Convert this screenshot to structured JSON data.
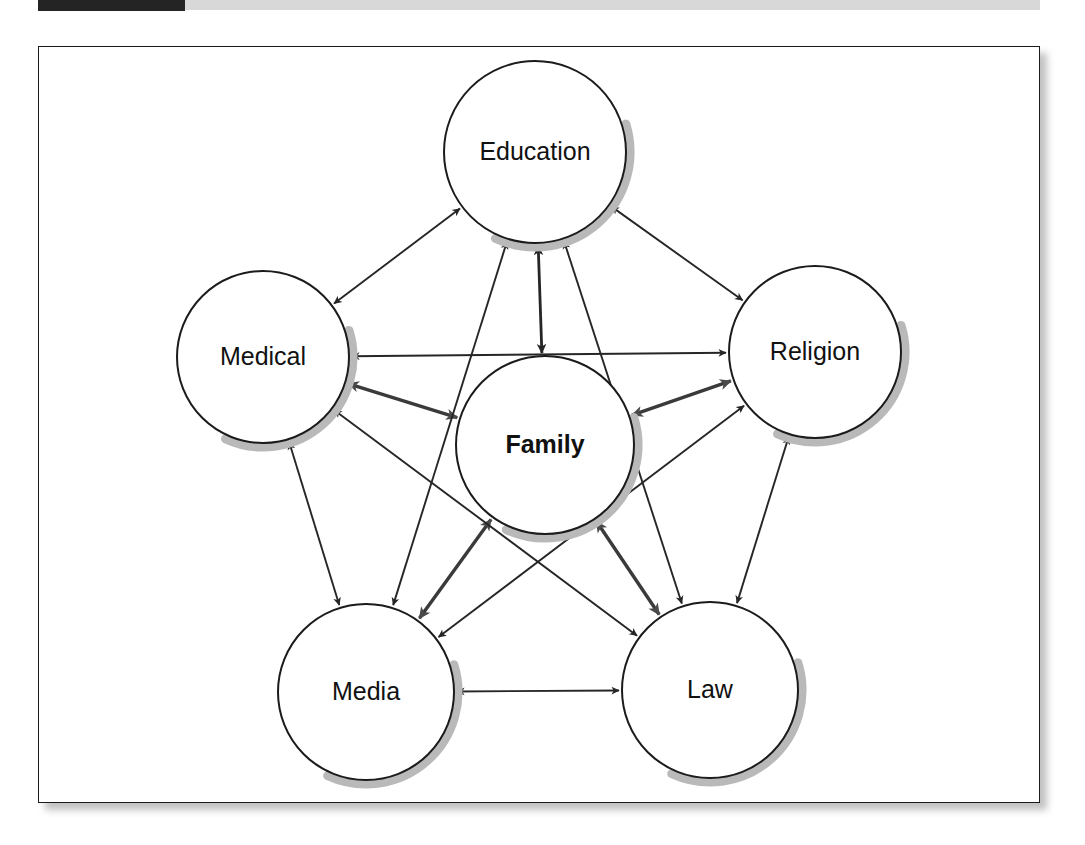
{
  "header": {
    "figure_tag": "",
    "band_color": "#d8d8d8",
    "tag_color": "#242424"
  },
  "figure": {
    "frame_color": "#1b1b1b",
    "background": "#ffffff",
    "shadow_color": "#b9b9b9"
  },
  "diagram": {
    "title": "",
    "type": "network",
    "node_fill": "#ffffff",
    "node_stroke": "#1b1b1b",
    "edge_color": "#262626",
    "emphasis_edge_color": "#3a3a3a",
    "nodes": [
      {
        "id": "education",
        "label": "Education",
        "cx": 535,
        "cy": 152,
        "r": 91,
        "bold": false
      },
      {
        "id": "medical",
        "label": "Medical",
        "cx": 263,
        "cy": 357,
        "r": 86,
        "bold": false
      },
      {
        "id": "religion",
        "label": "Religion",
        "cx": 815,
        "cy": 352,
        "r": 86,
        "bold": false
      },
      {
        "id": "family",
        "label": "Family",
        "cx": 545,
        "cy": 445,
        "r": 89,
        "bold": true
      },
      {
        "id": "media",
        "label": "Media",
        "cx": 366,
        "cy": 692,
        "r": 88,
        "bold": false
      },
      {
        "id": "law",
        "label": "Law",
        "cx": 710,
        "cy": 690,
        "r": 88,
        "bold": false
      }
    ],
    "edges": [
      {
        "from": "family",
        "to": "education",
        "weight": "medium",
        "bidirectional": true
      },
      {
        "from": "family",
        "to": "medical",
        "weight": "thick",
        "bidirectional": true
      },
      {
        "from": "family",
        "to": "religion",
        "weight": "thick",
        "bidirectional": true
      },
      {
        "from": "family",
        "to": "media",
        "weight": "thick",
        "bidirectional": true
      },
      {
        "from": "family",
        "to": "law",
        "weight": "thick",
        "bidirectional": true
      },
      {
        "from": "education",
        "to": "medical",
        "weight": "thin",
        "bidirectional": true
      },
      {
        "from": "education",
        "to": "religion",
        "weight": "thin",
        "bidirectional": true
      },
      {
        "from": "education",
        "to": "media",
        "weight": "thin",
        "bidirectional": true
      },
      {
        "from": "education",
        "to": "law",
        "weight": "thin",
        "bidirectional": true
      },
      {
        "from": "medical",
        "to": "religion",
        "weight": "thin",
        "bidirectional": true
      },
      {
        "from": "medical",
        "to": "media",
        "weight": "thin",
        "bidirectional": true
      },
      {
        "from": "medical",
        "to": "law",
        "weight": "thin",
        "bidirectional": true
      },
      {
        "from": "religion",
        "to": "media",
        "weight": "thin",
        "bidirectional": true
      },
      {
        "from": "religion",
        "to": "law",
        "weight": "thin",
        "bidirectional": true
      },
      {
        "from": "media",
        "to": "law",
        "weight": "thin",
        "bidirectional": true
      }
    ]
  }
}
